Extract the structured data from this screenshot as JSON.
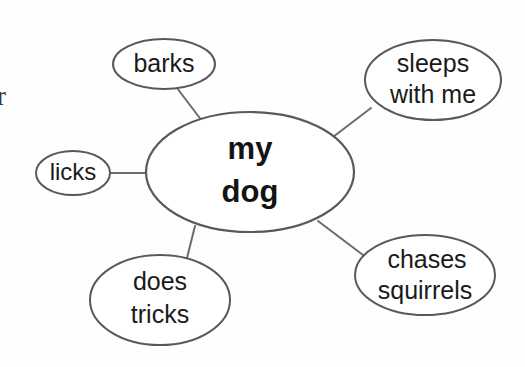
{
  "diagram": {
    "type": "word-web",
    "title_node": {
      "id": "center",
      "label_line1": "my",
      "label_line2": "dog",
      "cx": 250,
      "cy": 172,
      "rx": 104,
      "ry": 60
    },
    "nodes": [
      {
        "id": "barks",
        "label_line1": "barks",
        "label_line2": "",
        "cx": 164,
        "cy": 64,
        "rx": 51,
        "ry": 25
      },
      {
        "id": "sleeps-with-me",
        "label_line1": "sleeps",
        "label_line2": "with me",
        "cx": 433,
        "cy": 80,
        "rx": 68,
        "ry": 40
      },
      {
        "id": "licks",
        "label_line1": "licks",
        "label_line2": "",
        "cx": 73,
        "cy": 173,
        "rx": 37,
        "ry": 22
      },
      {
        "id": "does-tricks",
        "label_line1": "does",
        "label_line2": "tricks",
        "cx": 160,
        "cy": 300,
        "rx": 70,
        "ry": 45
      },
      {
        "id": "chases-squirrels",
        "label_line1": "chases",
        "label_line2": "squirrels",
        "cx": 425,
        "cy": 275,
        "rx": 70,
        "ry": 40
      }
    ],
    "edges": [
      {
        "id": "edge-barks",
        "from": "center",
        "to": "barks",
        "x1": 202,
        "y1": 121,
        "x2": 177,
        "y2": 88
      },
      {
        "id": "edge-sleeps-with-me",
        "from": "center",
        "to": "sleeps-with-me",
        "x1": 333,
        "y1": 137,
        "x2": 371,
        "y2": 108
      },
      {
        "id": "edge-licks",
        "from": "center",
        "to": "licks",
        "x1": 146,
        "y1": 173,
        "x2": 110,
        "y2": 173
      },
      {
        "id": "edge-does-tricks",
        "from": "center",
        "to": "does-tricks",
        "x1": 195,
        "y1": 226,
        "x2": 187,
        "y2": 258
      },
      {
        "id": "edge-chases-squirrels",
        "from": "center",
        "to": "chases-squirrels",
        "x1": 318,
        "y1": 221,
        "x2": 363,
        "y2": 255
      }
    ],
    "edge_artifact": {
      "text": "r",
      "x": -3,
      "y": 99
    },
    "colors": {
      "background": "#fefefe",
      "ellipse_stroke": "#595959",
      "connector_stroke": "#6b6b6b",
      "node_text": "#1a1a1a",
      "center_text": "#141414"
    }
  }
}
